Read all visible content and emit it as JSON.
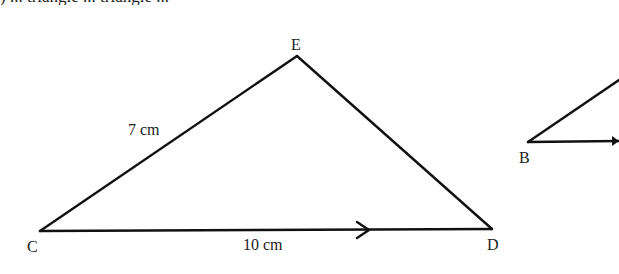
{
  "header": {
    "cut_off_text": ") ... triangle ... triangle ..."
  },
  "triangle_cde": {
    "vertices": {
      "C": {
        "label": "C",
        "x": 40,
        "y": 231
      },
      "E": {
        "label": "E",
        "x": 297,
        "y": 56
      },
      "D": {
        "label": "D",
        "x": 492,
        "y": 229
      }
    },
    "sides": {
      "CE": {
        "label": "7 cm"
      },
      "CD": {
        "label": "10 cm",
        "marker": "arrow"
      }
    }
  },
  "triangle_b": {
    "vertices": {
      "B": {
        "label": "B",
        "x": 528,
        "y": 142
      }
    },
    "note": "partially cropped at right edge"
  },
  "colors": {
    "line": "#111111",
    "text": "#222222",
    "background": "#ffffff"
  }
}
